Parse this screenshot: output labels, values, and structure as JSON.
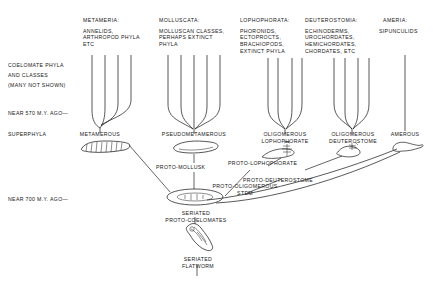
{
  "figure": {
    "background": "#ffffff",
    "ink": "#1a1a1a"
  },
  "left_axis": {
    "caption_lines": [
      "COELOMATE PHYLA",
      "AND CLASSES",
      "(MANY NOT SHOWN)"
    ],
    "time_marker_upper": "NEAR 570 M.Y. AGO—",
    "row_label_superphyla": "SUPERPHYLA",
    "time_marker_lower": "NEAR 700 M.Y. AGO—"
  },
  "columns": [
    {
      "key": "metameria",
      "heading": "METAMERIA:",
      "members": [
        "ANNELIDS,",
        "ARTHROPOD PHYLA",
        "ETC"
      ],
      "superphylum_label": [
        "METAMEROUS"
      ],
      "branch_count": 4,
      "stem_x": 100
    },
    {
      "key": "molluscata",
      "heading": "MOLLUSCATA:",
      "members": [
        "MOLLUSCAN CLASSES,",
        "PERHAPS EXTINCT",
        "PHYLA"
      ],
      "superphylum_label": [
        "PSEUDOMETAMEROUS"
      ],
      "branch_count": 5,
      "stem_x": 194
    },
    {
      "key": "lophophorata",
      "heading": "LOPHOPHORATA:",
      "members": [
        "PHORONIDS,",
        "ECTOPROCTS,",
        "BRACHIOPODS,",
        "EXTINCT PHYLA"
      ],
      "superphylum_label": [
        "OLIGOMEROUS",
        "LOPHOPHORATE"
      ],
      "branch_count": 4,
      "stem_x": 285
    },
    {
      "key": "deuterostomia",
      "heading": "DEUTEROSTOMIA:",
      "members": [
        "ECHINODERMS,",
        "UROCHORDATES,",
        "HEMICHORDATES,",
        "CHORDATES, ETC"
      ],
      "superphylum_label": [
        "OLIGOMEROUS",
        "DEUTEROSTOME"
      ],
      "branch_count": 4,
      "stem_x": 352
    },
    {
      "key": "ameria",
      "heading": "AMERIA:",
      "members": [
        "SIPUNCULIDS"
      ],
      "superphylum_label": [
        "AMEROUS"
      ],
      "branch_count": 1,
      "stem_x": 405
    }
  ],
  "ancestor_nodes": [
    {
      "key": "proto-mollusk",
      "label": "PROTO-MOLLUSK"
    },
    {
      "key": "proto-lophophorate",
      "label": "PROTO-LOPHOPHORATE"
    },
    {
      "key": "proto-deuterostome",
      "label": "PROTO-DEUTEROSTOME"
    },
    {
      "key": "proto-oligomerous-stem",
      "label": "PROTO-OLIGOMEROUS\nSTEM"
    },
    {
      "key": "seriated-proto-coelomates",
      "label": "SERIATED\nPROTO-COELOMATES"
    },
    {
      "key": "seriated-flatworm",
      "label": "SERIATED\nFLATWORM"
    }
  ],
  "organisms": [
    {
      "key": "metamerous-worm",
      "description": "segmented annelid-like worm"
    },
    {
      "key": "pseudometamerous-mollusk",
      "description": "flattened proto-mollusk body"
    },
    {
      "key": "lophophorate-body",
      "description": "lophophorate with tentacle crown"
    },
    {
      "key": "deuterostome-body",
      "description": "small deuterostome larva form"
    },
    {
      "key": "amerous-sipunculid",
      "description": "unsegmented sipunculid sac"
    },
    {
      "key": "proto-coelomate-ring",
      "description": "oval seriated proto-coelomate"
    },
    {
      "key": "flatworm-body",
      "description": "seriated flatworm"
    }
  ]
}
